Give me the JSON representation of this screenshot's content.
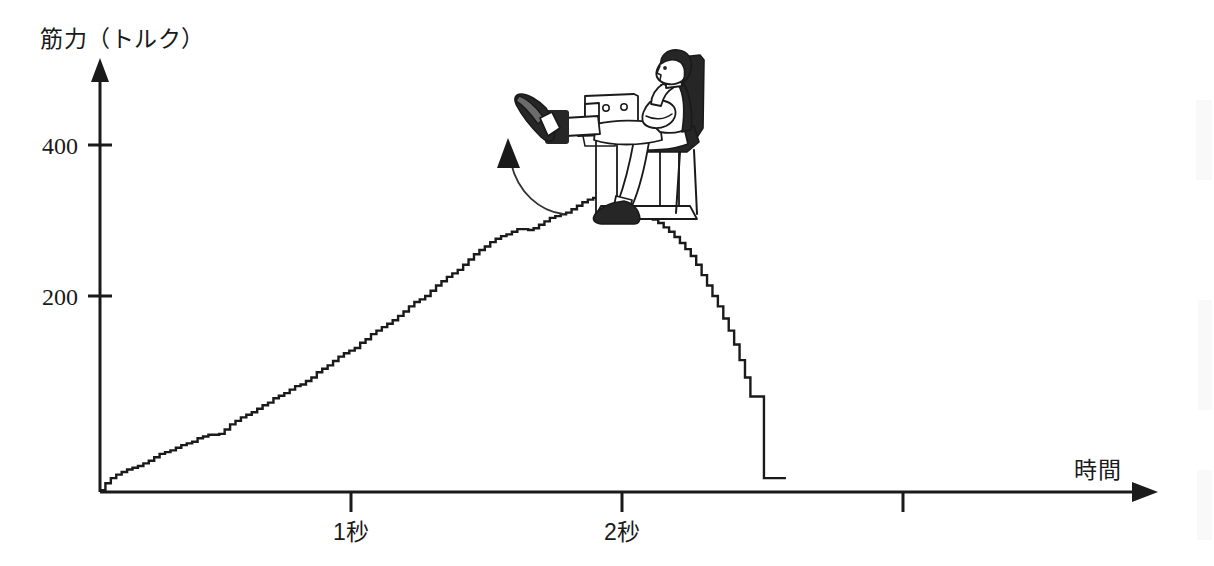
{
  "figure": {
    "type": "scientific-illustration-with-chart",
    "background_color": "#ffffff",
    "ink_color": "#1a1a1a"
  },
  "chart_data": {
    "type": "line",
    "title": "",
    "subtitle": "",
    "xlabel": "時間",
    "ylabel": "筋力（トルク）",
    "x_tick_labels": [
      "1秒",
      "2秒",
      ""
    ],
    "x_tick_values": [
      1,
      2,
      3
    ],
    "y_tick_labels": [
      "200",
      "400"
    ],
    "y_tick_values": [
      200,
      400
    ],
    "xlim": [
      0,
      4.12
    ],
    "ylim": [
      0,
      530
    ],
    "grid": false,
    "legend": "none",
    "series": [
      {
        "name": "膝伸展トルク",
        "x": [
          0.0,
          0.02,
          0.04,
          0.06,
          0.08,
          0.1,
          0.12,
          0.14,
          0.16,
          0.18,
          0.2,
          0.22,
          0.24,
          0.26,
          0.28,
          0.3,
          0.32,
          0.34,
          0.36,
          0.38,
          0.4,
          0.42,
          0.44,
          0.46,
          0.48,
          0.5,
          0.52,
          0.54,
          0.56,
          0.58,
          0.6,
          0.62,
          0.64,
          0.66,
          0.68,
          0.7,
          0.72,
          0.74,
          0.76,
          0.78,
          0.8,
          0.82,
          0.84,
          0.86,
          0.88,
          0.9,
          0.92,
          0.94,
          0.96,
          0.98,
          1.0,
          1.02,
          1.04,
          1.06,
          1.08,
          1.1,
          1.12,
          1.14,
          1.16,
          1.18,
          1.2,
          1.22,
          1.24,
          1.26,
          1.28,
          1.3,
          1.32,
          1.34,
          1.36,
          1.38,
          1.4,
          1.42,
          1.44,
          1.46,
          1.48,
          1.5,
          1.52,
          1.54,
          1.56,
          1.58,
          1.6,
          1.62,
          1.64,
          1.66,
          1.68,
          1.7,
          1.72,
          1.74,
          1.76,
          1.78,
          1.8,
          1.82,
          1.84,
          1.86,
          1.88,
          1.9,
          1.92,
          1.94,
          1.96,
          1.98,
          2.0,
          2.02,
          2.04,
          2.06,
          2.08,
          2.1,
          2.12,
          2.14,
          2.16,
          2.18,
          2.2,
          2.22,
          2.24,
          2.26,
          2.28,
          2.3,
          2.32,
          2.34,
          2.36,
          2.38,
          2.4,
          2.45
        ],
        "y": [
          2,
          10,
          16,
          20,
          23,
          26,
          28,
          30,
          33,
          36,
          40,
          44,
          46,
          48,
          51,
          54,
          56,
          58,
          62,
          64,
          66,
          66,
          67,
          72,
          78,
          82,
          86,
          89,
          92,
          96,
          100,
          103,
          108,
          111,
          114,
          118,
          122,
          124,
          128,
          132,
          138,
          142,
          146,
          151,
          156,
          160,
          163,
          166,
          172,
          176,
          182,
          186,
          190,
          194,
          198,
          203,
          208,
          214,
          219,
          222,
          226,
          232,
          238,
          243,
          248,
          252,
          256,
          262,
          268,
          274,
          279,
          283,
          288,
          292,
          295,
          297,
          300,
          303,
          303,
          302,
          304,
          308,
          312,
          316,
          318,
          320,
          322,
          326,
          330,
          334,
          337,
          339,
          340,
          338,
          336,
          334,
          332,
          330,
          328,
          326,
          322,
          318,
          314,
          310,
          305,
          300,
          294,
          287,
          280,
          272,
          262,
          250,
          238,
          226,
          214,
          200,
          186,
          170,
          152,
          132,
          110,
          16
        ]
      }
    ],
    "annotations": [
      {
        "name": "exercise-illustration",
        "description": "seated leg-extension (isokinetic dynamometer) exercise",
        "motion_arrow_direction": "upward"
      }
    ]
  },
  "axes": {
    "y_axis_label": "筋力（トルク）",
    "x_axis_label": "時間",
    "y_ticks": [
      {
        "label": "400",
        "value": 400
      },
      {
        "label": "200",
        "value": 200
      }
    ],
    "x_ticks": [
      {
        "label": "1秒",
        "value": 1
      },
      {
        "label": "2秒",
        "value": 2
      },
      {
        "label": "",
        "value": 3
      }
    ],
    "y_arrow": "up-arrow-icon",
    "x_arrow": "right-arrow-icon"
  },
  "illustration": {
    "name": "seated-leg-extension-figure",
    "motion_arrow": "curved-up-arrow-icon",
    "parts": [
      "person-head",
      "person-torso",
      "crossed-arms",
      "thigh",
      "shin",
      "shoe",
      "ankle-pad",
      "machine-lever-arm",
      "seat-back",
      "seat-base"
    ]
  }
}
